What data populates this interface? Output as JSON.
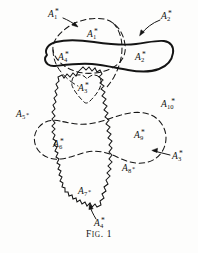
{
  "figure": {
    "caption_prefix": "F",
    "caption_rest": "IG",
    "caption_dot": ". ",
    "caption_number": "1",
    "caption_full": "Fig. 1",
    "ink_color": "#141414",
    "background_color": "#fdfdfc"
  },
  "labels": {
    "a1_outer": {
      "base": "A",
      "sub": "1",
      "star": "*"
    },
    "a1_inner": {
      "base": "A",
      "sub": "1",
      "star": "*"
    },
    "a2_outer": {
      "base": "A",
      "sub": "2",
      "star": "*"
    },
    "a2_inner": {
      "base": "A",
      "sub": "2",
      "star": "*"
    },
    "a4_inner": {
      "base": "A",
      "sub": "4",
      "star": "*"
    },
    "a3_inner": {
      "base": "A",
      "sub": "3",
      "star": "*"
    },
    "a5": {
      "base": "A",
      "sub": "5",
      "star": "*"
    },
    "a10": {
      "base": "A",
      "sub": "10",
      "star": "*"
    },
    "a6": {
      "base": "A",
      "sub": "6",
      "star": "*"
    },
    "a9": {
      "base": "A",
      "sub": "9",
      "star": "*"
    },
    "a8": {
      "base": "A",
      "sub": "8",
      "star": "*"
    },
    "a3_outer": {
      "base": "A",
      "sub": "3",
      "star": "*"
    },
    "a7": {
      "base": "A",
      "sub": "7",
      "star": "*"
    },
    "a4_outer": {
      "base": "A",
      "sub": "4",
      "star": "*"
    }
  },
  "regions": {
    "a1_dashed": "upper dashed closed curve",
    "a2_a4_solid": "thick solid elongated blob",
    "a3_dashed": "small dashed heart shaped region",
    "lower_dashed": "large lower dashed blob spanning A6 A9 A8",
    "a7_jagged": "vertical zigzag jagged region"
  },
  "leaders": {
    "a1_arrow": "arrow from A1 label to upper dashed curve",
    "a2_arrow": "curved arrow from A2 label to solid blob",
    "a3_arrow": "arrow from A3 label to lower dashed blob",
    "a4_arrow": "curved arrow from A4 label up to jagged region",
    "a1_leader": "long dashed leader from A1 region down-left"
  }
}
